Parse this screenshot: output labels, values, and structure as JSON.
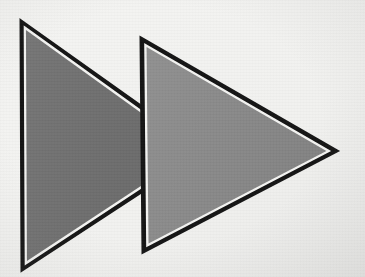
{
  "scene": {
    "title": "Two overlapping right-pointing triangles",
    "width": 365,
    "height": 277,
    "background_color": "#f2f2f0",
    "background_color_edge": "#e9e9e7",
    "caption": ""
  },
  "shapes": [
    {
      "id": "triangle-back",
      "name": "back-triangle",
      "label": "Back triangle (darker)",
      "fill_color": "#6e6e6e",
      "fill_color_light": "#767676",
      "stroke_color": "#141414",
      "inner_gap_color": "#f4f4f2",
      "stroke_width": 3,
      "inner_gap_width": 1.6,
      "points": "21,21 204,151 22,270",
      "inner_points": "24.5,27 197,151 25.5,264",
      "vertices": [
        {
          "name": "top-left",
          "x": 21,
          "y": 21
        },
        {
          "name": "right-apex",
          "x": 204,
          "y": 151
        },
        {
          "name": "bottom-left",
          "x": 22,
          "y": 270
        }
      ]
    },
    {
      "id": "triangle-front",
      "name": "front-triangle",
      "label": "Front triangle (lighter)",
      "fill_color": "#888888",
      "fill_color_light": "#909090",
      "stroke_color": "#141414",
      "inner_gap_color": "#f4f4f2",
      "stroke_width": 3,
      "inner_gap_width": 1.6,
      "points": "141,38 337,151 143,252",
      "inner_points": "145,44.5 329.5,151 147,246",
      "vertices": [
        {
          "name": "top-left",
          "x": 141,
          "y": 38
        },
        {
          "name": "right-apex",
          "x": 337,
          "y": 151
        },
        {
          "name": "bottom-left",
          "x": 143,
          "y": 252
        }
      ]
    }
  ]
}
